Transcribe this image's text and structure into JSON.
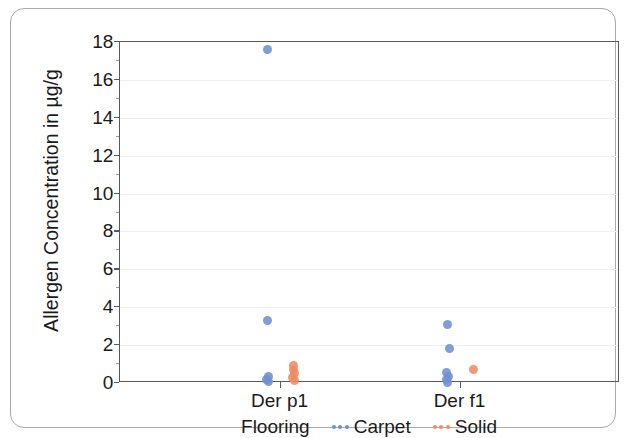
{
  "chart_data": {
    "type": "scatter",
    "title": "",
    "xlabel": "",
    "ylabel": "Allergen Concentration in µg/g",
    "ylim": [
      0,
      18
    ],
    "ytick_labels": [
      "0",
      "2",
      "4",
      "6",
      "8",
      "10",
      "12",
      "14",
      "16",
      "18"
    ],
    "ytick_values": [
      0,
      2,
      4,
      6,
      8,
      10,
      12,
      14,
      16,
      18
    ],
    "categories": [
      "Der p1",
      "Der f1"
    ],
    "grid": true,
    "legend_position": "bottom",
    "legend_title": "Flooring",
    "series": [
      {
        "name": "Carpet",
        "color": "#6e8fd0",
        "points": [
          {
            "category": "Der p1",
            "value": 17.6
          },
          {
            "category": "Der p1",
            "value": 3.3
          },
          {
            "category": "Der p1",
            "value": 0.35
          },
          {
            "category": "Der p1",
            "value": 0.2
          },
          {
            "category": "Der p1",
            "value": 0.1
          },
          {
            "category": "Der f1",
            "value": 3.1
          },
          {
            "category": "Der f1",
            "value": 1.8
          },
          {
            "category": "Der f1",
            "value": 0.55
          },
          {
            "category": "Der f1",
            "value": 0.35
          },
          {
            "category": "Der f1",
            "value": 0.18
          },
          {
            "category": "Der f1",
            "value": 0.05
          }
        ]
      },
      {
        "name": "Solid",
        "color": "#ef8a62",
        "points": [
          {
            "category": "Der p1",
            "value": 0.9
          },
          {
            "category": "Der p1",
            "value": 0.72
          },
          {
            "category": "Der p1",
            "value": 0.5
          },
          {
            "category": "Der p1",
            "value": 0.3
          },
          {
            "category": "Der p1",
            "value": 0.12
          },
          {
            "category": "Der f1",
            "value": 0.7
          }
        ]
      }
    ]
  },
  "legend": {
    "title": "Flooring",
    "entries": [
      {
        "label": "Carpet",
        "color": "#6e8fd0",
        "marker": "dotted-line-marker"
      },
      {
        "label": "Solid",
        "color": "#ef8a62",
        "marker": "dotted-line-marker"
      }
    ]
  },
  "axes": {
    "y_title": "Allergen Concentration in µg/g",
    "y_ticks": [
      "18",
      "16",
      "14",
      "12",
      "10",
      "8",
      "6",
      "4",
      "2",
      "0"
    ],
    "x_ticks": [
      "Der p1",
      "Der f1"
    ]
  }
}
